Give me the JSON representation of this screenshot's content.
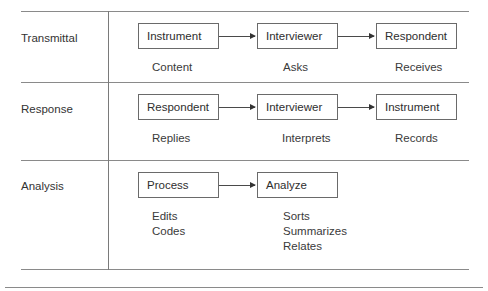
{
  "rows": [
    {
      "label": "Transmittal",
      "steps": [
        {
          "box": "Instrument",
          "sub": [
            "Content"
          ]
        },
        {
          "box": "Interviewer",
          "sub": [
            "Asks"
          ]
        },
        {
          "box": "Respondent",
          "sub": [
            "Receives"
          ]
        }
      ]
    },
    {
      "label": "Response",
      "steps": [
        {
          "box": "Respondent",
          "sub": [
            "Replies"
          ]
        },
        {
          "box": "Interviewer",
          "sub": [
            "Interprets"
          ]
        },
        {
          "box": "Instrument",
          "sub": [
            "Records"
          ]
        }
      ]
    },
    {
      "label": "Analysis",
      "steps": [
        {
          "box": "Process",
          "sub": [
            "Edits",
            "Codes"
          ]
        },
        {
          "box": "Analyze",
          "sub": [
            "Sorts",
            "Summarizes",
            "Relates"
          ]
        }
      ]
    }
  ]
}
